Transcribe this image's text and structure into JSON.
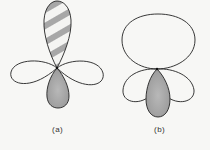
{
  "figure": {
    "panels": [
      {
        "id": "a",
        "label": "(a)",
        "description": "Four-lobed orbital: hatched upper lobe, shaded lower lobe, two open side lobes"
      },
      {
        "id": "b",
        "label": "(b)",
        "description": "Hybrid orbital: large open upper lobe, shaded lower teardrop lobe, two open side lobes"
      }
    ],
    "colors": {
      "outline": "#222222",
      "shaded_fill": "#a8a8a8",
      "hatch_stripe": "#9a9a9a",
      "background": "#f7f7f5"
    }
  }
}
